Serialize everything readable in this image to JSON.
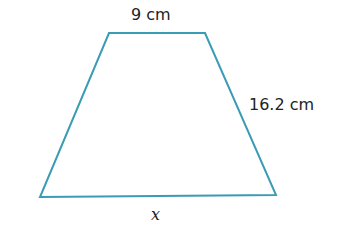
{
  "figure": {
    "shape": "trapezoid",
    "stroke_color": "#3a9bb5",
    "vertices": [
      [
        109,
        33
      ],
      [
        205,
        33
      ],
      [
        276,
        195
      ],
      [
        40,
        197
      ]
    ],
    "labels": {
      "top": "9 cm",
      "right_side": "16.2 cm",
      "bottom": "x"
    }
  }
}
